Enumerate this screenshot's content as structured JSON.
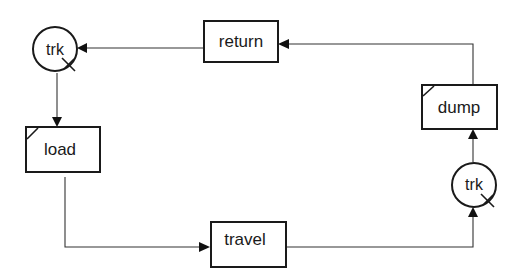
{
  "diagram": {
    "type": "activity cycle diagram",
    "nodes": [
      {
        "id": "trk_queue_1",
        "kind": "queue",
        "label": "trk"
      },
      {
        "id": "return",
        "kind": "activity",
        "label": "return"
      },
      {
        "id": "load",
        "kind": "activity",
        "label": "load",
        "corner_marker": true
      },
      {
        "id": "travel",
        "kind": "activity",
        "label": "travel"
      },
      {
        "id": "trk_queue_2",
        "kind": "queue",
        "label": "trk"
      },
      {
        "id": "dump",
        "kind": "activity",
        "label": "dump",
        "corner_marker": true
      }
    ],
    "edges": [
      {
        "from": "return",
        "to": "trk_queue_1"
      },
      {
        "from": "trk_queue_1",
        "to": "load"
      },
      {
        "from": "load",
        "to": "travel"
      },
      {
        "from": "travel",
        "to": "trk_queue_2"
      },
      {
        "from": "trk_queue_2",
        "to": "dump"
      },
      {
        "from": "dump",
        "to": "return"
      }
    ],
    "colors": {
      "stroke": "#1a1a1a",
      "background": "#ffffff"
    }
  }
}
